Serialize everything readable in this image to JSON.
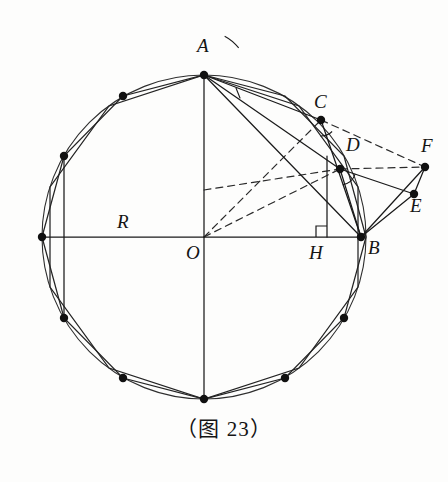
{
  "figure": {
    "caption": "（图 23）",
    "background_color": "#fdfdfc",
    "stroke_color": "#1a1a1a",
    "dash_color": "#2a2a2a"
  },
  "circle": {
    "center": {
      "x": 204,
      "y": 237,
      "label": "O"
    },
    "radius": 162,
    "radius_label": "R"
  },
  "labels": [
    {
      "name": "A",
      "text": "A",
      "x": 197,
      "y": 36
    },
    {
      "name": "C",
      "text": "C",
      "x": 314,
      "y": 92
    },
    {
      "name": "D",
      "text": "D",
      "x": 346,
      "y": 135
    },
    {
      "name": "F",
      "text": "F",
      "x": 421,
      "y": 136
    },
    {
      "name": "E",
      "text": "E",
      "x": 410,
      "y": 196
    },
    {
      "name": "B",
      "text": "B",
      "x": 368,
      "y": 238
    },
    {
      "name": "H",
      "text": "H",
      "x": 309,
      "y": 243
    },
    {
      "name": "O",
      "text": "O",
      "x": 186,
      "y": 243
    },
    {
      "name": "R",
      "text": "R",
      "x": 117,
      "y": 212
    }
  ],
  "points": {
    "A": {
      "x": 204,
      "y": 75
    },
    "B": {
      "x": 361,
      "y": 237
    },
    "C": {
      "x": 321,
      "y": 120
    },
    "D": {
      "x": 340,
      "y": 169
    },
    "E": {
      "x": 414,
      "y": 194
    },
    "F": {
      "x": 425,
      "y": 167
    },
    "H": {
      "x": 327,
      "y": 237
    },
    "O": {
      "x": 204,
      "y": 237
    },
    "W": {
      "x": 42,
      "y": 237
    },
    "S": {
      "x": 204,
      "y": 399
    }
  },
  "polygons": {
    "dodecagon": {
      "sides": 12,
      "vertices": [
        {
          "x": 204,
          "y": 75
        },
        {
          "x": 285,
          "y": 96
        },
        {
          "x": 344,
          "y": 156
        },
        {
          "x": 366,
          "y": 237
        },
        {
          "x": 344,
          "y": 318
        },
        {
          "x": 285,
          "y": 378
        },
        {
          "x": 204,
          "y": 399
        },
        {
          "x": 123,
          "y": 378
        },
        {
          "x": 64,
          "y": 318
        },
        {
          "x": 42,
          "y": 237
        },
        {
          "x": 64,
          "y": 156
        },
        {
          "x": 123,
          "y": 96
        }
      ]
    },
    "decagon": {
      "sides": 10,
      "vertices": [
        {
          "x": 204,
          "y": 75
        },
        {
          "x": 299,
          "y": 106
        },
        {
          "x": 358,
          "y": 187
        },
        {
          "x": 358,
          "y": 287
        },
        {
          "x": 299,
          "y": 368
        },
        {
          "x": 204,
          "y": 399
        },
        {
          "x": 109,
          "y": 368
        },
        {
          "x": 50,
          "y": 287
        },
        {
          "x": 50,
          "y": 187
        },
        {
          "x": 109,
          "y": 106
        }
      ]
    }
  },
  "marked_vertices": [
    {
      "name": "vertex-top-A",
      "x": 204,
      "y": 75
    },
    {
      "name": "vertex-upper-left-1",
      "x": 123,
      "y": 96
    },
    {
      "name": "vertex-upper-left-2",
      "x": 64,
      "y": 156
    },
    {
      "name": "vertex-left-W",
      "x": 42,
      "y": 237
    },
    {
      "name": "vertex-lower-left-1",
      "x": 64,
      "y": 318
    },
    {
      "name": "vertex-lower-left-2",
      "x": 123,
      "y": 378
    },
    {
      "name": "vertex-bottom-S",
      "x": 204,
      "y": 399
    },
    {
      "name": "vertex-lower-right-2",
      "x": 285,
      "y": 378
    },
    {
      "name": "vertex-lower-right-1",
      "x": 344,
      "y": 318
    },
    {
      "name": "vertex-right-B",
      "x": 361,
      "y": 237
    },
    {
      "name": "vertex-C",
      "x": 321,
      "y": 120
    },
    {
      "name": "vertex-D",
      "x": 340,
      "y": 169
    },
    {
      "name": "vertex-E",
      "x": 414,
      "y": 194
    },
    {
      "name": "vertex-F",
      "x": 425,
      "y": 167
    }
  ],
  "solid_segments": [
    {
      "name": "radius-OW",
      "x1": 42,
      "y1": 237,
      "x2": 361,
      "y2": 237
    },
    {
      "name": "diameter-AS",
      "x1": 204,
      "y1": 75,
      "x2": 204,
      "y2": 399
    },
    {
      "name": "chord-AC",
      "x1": 204,
      "y1": 75,
      "x2": 321,
      "y2": 120
    },
    {
      "name": "chord-AD",
      "x1": 204,
      "y1": 75,
      "x2": 340,
      "y2": 169
    },
    {
      "name": "chord-AB",
      "x1": 204,
      "y1": 75,
      "x2": 361,
      "y2": 237
    },
    {
      "name": "chord-CB",
      "x1": 321,
      "y1": 120,
      "x2": 361,
      "y2": 237
    },
    {
      "name": "chord-DB",
      "x1": 340,
      "y1": 169,
      "x2": 361,
      "y2": 237
    },
    {
      "name": "segment-BE",
      "x1": 361,
      "y1": 237,
      "x2": 414,
      "y2": 194
    },
    {
      "name": "segment-BF",
      "x1": 361,
      "y1": 237,
      "x2": 425,
      "y2": 167
    },
    {
      "name": "segment-EF",
      "x1": 414,
      "y1": 194,
      "x2": 425,
      "y2": 167
    },
    {
      "name": "segment-DE",
      "x1": 340,
      "y1": 169,
      "x2": 414,
      "y2": 194
    },
    {
      "name": "perp-HD",
      "x1": 327,
      "y1": 237,
      "x2": 327,
      "y2": 156
    },
    {
      "name": "perp-left-chord",
      "x1": 64,
      "y1": 156,
      "x2": 64,
      "y2": 318
    }
  ],
  "dashed_segments": [
    {
      "name": "dashed-OC",
      "x1": 204,
      "y1": 237,
      "x2": 321,
      "y2": 120
    },
    {
      "name": "dashed-OD",
      "x1": 204,
      "y1": 237,
      "x2": 340,
      "y2": 169
    },
    {
      "name": "dashed-CF",
      "x1": 321,
      "y1": 120,
      "x2": 425,
      "y2": 167
    },
    {
      "name": "dashed-DF",
      "x1": 340,
      "y1": 169,
      "x2": 425,
      "y2": 167
    },
    {
      "name": "dashed-OF-extension",
      "x1": 204,
      "y1": 190,
      "x2": 340,
      "y2": 169
    }
  ],
  "angle_marks": [
    {
      "name": "angle-arc-at-A",
      "cx": 204,
      "cy": 75,
      "r": 44,
      "a1": -62,
      "a2": -38
    },
    {
      "name": "angle-tick-at-A",
      "x1": 236,
      "y1": 88,
      "x2": 240,
      "y2": 98
    },
    {
      "name": "angle-arc-at-C",
      "cx": 321,
      "cy": 120,
      "r": 16,
      "a1": 46,
      "a2": 92
    },
    {
      "name": "angle-arc-at-D",
      "cx": 340,
      "cy": 169,
      "r": 16,
      "a1": 18,
      "a2": 80
    }
  ],
  "right_angle": {
    "name": "right-angle-at-H",
    "vertex": {
      "x": 327,
      "y": 237
    },
    "size": 11,
    "dir_x": -1,
    "dir_y": -1
  }
}
